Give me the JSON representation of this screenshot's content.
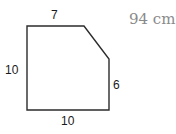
{
  "figure": {
    "shape": "pentagon (rectangle with one corner cut)",
    "stroke_color": "#2b2b2b",
    "vertices": [
      [
        27,
        26
      ],
      [
        84,
        26
      ],
      [
        109,
        59
      ],
      [
        109,
        110
      ],
      [
        27,
        110
      ]
    ],
    "labels": {
      "top": "7",
      "left": "10",
      "right": "6",
      "bottom": "10"
    }
  },
  "answer": {
    "value": "94 cm",
    "exponent": "2",
    "color": "#8a8a8a"
  }
}
